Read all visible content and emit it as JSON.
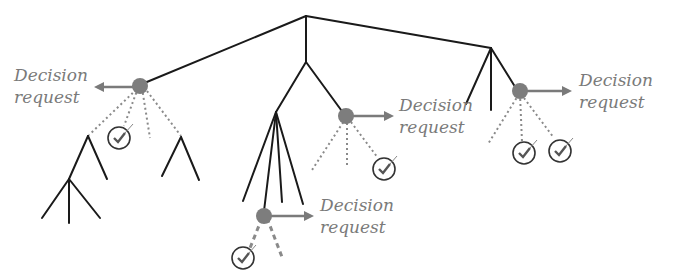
{
  "diagram": {
    "type": "game-tree",
    "colors": {
      "edge": "#1a1a1a",
      "decision_node": "#7d7d7d",
      "arrow": "#7a7a7a",
      "dashed_edge": "#8a8a8a",
      "label": "#7a7a7a",
      "check": "#333333"
    },
    "decision_requests": [
      {
        "id": "A",
        "line1": "Decision",
        "line2": "request",
        "arrow_direction": "left"
      },
      {
        "id": "B",
        "line1": "Decision",
        "line2": "request",
        "arrow_direction": "right"
      },
      {
        "id": "C",
        "line1": "Decision",
        "line2": "request",
        "arrow_direction": "right"
      },
      {
        "id": "D",
        "line1": "Decision",
        "line2": "request",
        "arrow_direction": "right"
      }
    ],
    "check_icons": 5
  }
}
